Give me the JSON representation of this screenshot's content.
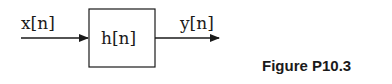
{
  "diagram": {
    "input_label": "x[n]",
    "system_label": "h[n]",
    "output_label": "y[n]",
    "stroke_color": "#1a1a1a"
  },
  "caption": "Figure P10.3"
}
